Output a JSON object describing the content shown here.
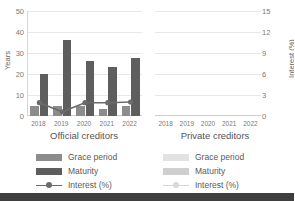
{
  "chart_data": {
    "type": "bar",
    "title": "",
    "subtitle": "",
    "categories": [
      "2018",
      "2019",
      "2020",
      "2021",
      "2022"
    ],
    "panels": [
      {
        "name": "official",
        "caption": "Official creditors",
        "series": [
          {
            "name": "Grace period",
            "axis": "left",
            "type": "bar",
            "values": [
              5,
              5,
              5,
              3.5,
              5
            ]
          },
          {
            "name": "Maturity",
            "axis": "left",
            "type": "bar",
            "values": [
              20,
              36,
              26,
              23.5,
              27.5
            ]
          },
          {
            "name": "Interest (%)",
            "axis": "right",
            "type": "line",
            "values": [
              1.9,
              0.6,
              1.9,
              1.9,
              2.0
            ]
          }
        ]
      },
      {
        "name": "private",
        "caption": "Private creditors",
        "series": [
          {
            "name": "Grace period",
            "axis": "left",
            "type": "bar",
            "values": [
              null,
              null,
              null,
              null,
              null
            ]
          },
          {
            "name": "Maturity",
            "axis": "left",
            "type": "bar",
            "values": [
              null,
              null,
              null,
              null,
              null
            ]
          },
          {
            "name": "Interest (%)",
            "axis": "right",
            "type": "line",
            "values": [
              null,
              null,
              null,
              null,
              null
            ]
          }
        ]
      }
    ],
    "ylabel": "Years",
    "ylabel_right": "Interest (%)",
    "xlabel": "",
    "ylim": [
      0,
      50
    ],
    "ylim_right": [
      0,
      15
    ],
    "yticks": [
      "0",
      "10",
      "20",
      "30",
      "40",
      "50"
    ],
    "yticks_right": [
      "0",
      "3",
      "6",
      "9",
      "12",
      "15"
    ],
    "grid": true,
    "legend_position": "bottom",
    "colors": {
      "grace_period": "#8c8c8c",
      "maturity": "#5e5e5e",
      "interest": "#6b6b6b",
      "grace_period_light": "#e2e2e2",
      "maturity_light": "#cfcfcf",
      "interest_light": "#d8d8d8",
      "gridline": "#e8e8e8",
      "text": "#5a5a5a",
      "bottom_bar": "#3f3f3f"
    }
  },
  "axes": {
    "left_title": "Years",
    "right_title": "Interest (%)",
    "left_ticks": [
      "50",
      "40",
      "30",
      "20",
      "10",
      "0"
    ],
    "right_ticks": [
      "15",
      "12",
      "9",
      "6",
      "3",
      "0"
    ]
  },
  "panels": {
    "official": {
      "caption": "Official creditors",
      "xticks": [
        "2018",
        "2019",
        "2020",
        "2021",
        "2022"
      ],
      "legend": {
        "grace_period": "Grace period",
        "maturity": "Maturity",
        "interest": "Interest (%)"
      }
    },
    "private": {
      "caption": "Private creditors",
      "xticks": [
        "2018",
        "2019",
        "2020",
        "2021",
        "2022"
      ],
      "legend": {
        "grace_period": "Grace period",
        "maturity": "Maturity",
        "interest": "Interest (%)"
      }
    }
  }
}
